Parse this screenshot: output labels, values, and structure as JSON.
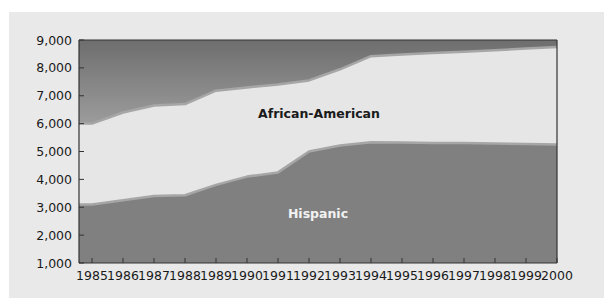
{
  "chart_data": {
    "type": "area",
    "stacked": true,
    "title": "",
    "xlabel": "",
    "ylabel": "",
    "x": [
      1985,
      1986,
      1987,
      1988,
      1989,
      1990,
      1991,
      1992,
      1993,
      1994,
      1995,
      1996,
      1997,
      1998,
      1999,
      2000
    ],
    "x_tick_labels": [
      "1985",
      "1986",
      "1987",
      "1988",
      "1989",
      "1990",
      "1991",
      "1992",
      "1993",
      "1994",
      "1995",
      "1996",
      "1997",
      "1998",
      "1999",
      "2000"
    ],
    "ylim": [
      1000,
      9000
    ],
    "y_ticks": [
      1000,
      2000,
      3000,
      4000,
      5000,
      6000,
      7000,
      8000,
      9000
    ],
    "y_tick_labels": [
      "1,000",
      "2,000",
      "3,000",
      "4,000",
      "5,000",
      "6,000",
      "7,000",
      "8,000",
      "9,000"
    ],
    "series": [
      {
        "name": "Hispanic",
        "label": "Hispanic",
        "cumulative_values": [
          3100,
          3250,
          3400,
          3430,
          3800,
          4100,
          4250,
          5000,
          5220,
          5330,
          5320,
          5310,
          5300,
          5290,
          5270,
          5250
        ],
        "color": "#808080",
        "label_color": "#f2f2f2"
      },
      {
        "name": "African-American",
        "label": "African-American",
        "cumulative_values": [
          6000,
          6400,
          6650,
          6700,
          7180,
          7300,
          7400,
          7550,
          7950,
          8420,
          8480,
          8530,
          8580,
          8630,
          8690,
          8750
        ],
        "color": "#e6e6e6",
        "label_color": "#1a1a1a"
      }
    ],
    "boundary_color": "#a6a6a6",
    "top_gradient": [
      "#6e6e6e",
      "#e8e8e8"
    ],
    "grid": false,
    "legend": "inline-labels"
  }
}
